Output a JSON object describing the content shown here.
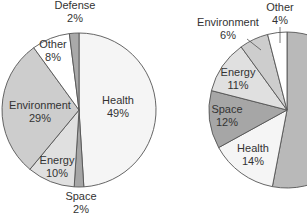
{
  "chart_data": [
    {
      "type": "pie",
      "title": "",
      "start_angle_deg": 0,
      "direction": "clockwise",
      "center": [
        79,
        110
      ],
      "radius": 77,
      "slices": [
        {
          "label": "Health",
          "value": 49,
          "display": "49%",
          "color": "#f5f5f5",
          "label_pos": [
            118,
            104
          ],
          "leader": null
        },
        {
          "label": "Space",
          "value": 2,
          "display": "2%",
          "color": "#a6a6a6",
          "label_pos": [
            81,
            200
          ],
          "leader": null
        },
        {
          "label": "Energy",
          "value": 10,
          "display": "10%",
          "color": "#e0e0e0",
          "label_pos": [
            57,
            164
          ],
          "leader": null
        },
        {
          "label": "Environment",
          "value": 29,
          "display": "29%",
          "color": "#cdcdcd",
          "label_pos": [
            40,
            109
          ],
          "leader": null
        },
        {
          "label": "Other",
          "value": 8,
          "display": "8%",
          "color": "#ffffff",
          "label_pos": [
            53,
            48
          ],
          "leader": null
        },
        {
          "label": "Defense",
          "value": 2,
          "display": "2%",
          "color": "#a9a9a9",
          "label_pos": [
            75,
            9
          ],
          "leader": null
        }
      ]
    },
    {
      "type": "pie",
      "title": "",
      "start_angle_deg": 0,
      "direction": "clockwise",
      "center": [
        287,
        110
      ],
      "radius": 78,
      "slices": [
        {
          "label": "Defense",
          "value": 53,
          "display": "",
          "color": "#b9b9b9",
          "label_pos": null,
          "leader": null
        },
        {
          "label": "Health",
          "value": 14,
          "display": "14%",
          "color": "#f5f5f5",
          "label_pos": [
            253,
            152
          ],
          "leader": null
        },
        {
          "label": "Space",
          "value": 12,
          "display": "12%",
          "color": "#a6a6a6",
          "label_pos": [
            227,
            113
          ],
          "leader": null
        },
        {
          "label": "Energy",
          "value": 11,
          "display": "11%",
          "color": "#e0e0e0",
          "label_pos": [
            238,
            76
          ],
          "leader": null
        },
        {
          "label": "Environment",
          "value": 6,
          "display": "6%",
          "color": "#cdcdcd",
          "label_pos": [
            228,
            26
          ],
          "leader": [
            [
              247,
              39
            ],
            [
              261,
              50
            ]
          ]
        },
        {
          "label": "Other",
          "value": 4,
          "display": "4%",
          "color": "#ffffff",
          "label_pos": [
            280,
            11
          ],
          "leader": [
            [
              280,
              27
            ],
            [
              280,
              43
            ]
          ]
        }
      ]
    }
  ],
  "style": {
    "stroke": "#555555",
    "text_color": "#333333",
    "background": "#ffffff"
  }
}
